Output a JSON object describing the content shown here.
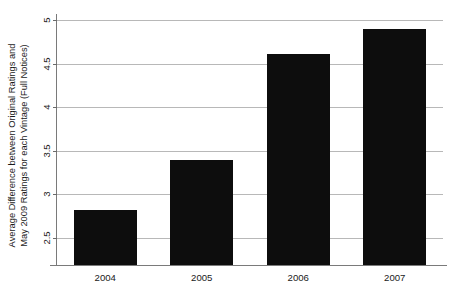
{
  "chart_data": {
    "type": "bar",
    "title": "",
    "subtitle": "",
    "xlabel": "",
    "ylabel": "Average Difference between Original Ratings and May 2009 Ratings for each Vintage (Full Notices)",
    "ylabel_lines": [
      "Average Difference between Original Ratings and",
      "May 2009 Ratings for each Vintage (Full Notices)"
    ],
    "categories": [
      "2004",
      "2005",
      "2006",
      "2007"
    ],
    "values": [
      2.82,
      3.4,
      4.61,
      4.9
    ],
    "series": [
      {
        "name": "Average Difference",
        "values": [
          2.82,
          3.4,
          4.61,
          4.9
        ]
      }
    ],
    "ylim": [
      2.19,
      5.0
    ],
    "y_axis_visible_min": 2.5,
    "yticks": [
      2.5,
      3,
      3.5,
      4,
      4.5,
      5
    ],
    "ytick_labels": [
      "2.5",
      "3",
      "3.5",
      "4",
      "4.5",
      "5"
    ],
    "xticks": [
      "2004",
      "2005",
      "2006",
      "2007"
    ],
    "grid": true,
    "grid_axis": "y",
    "legend": false,
    "legend_position": "none",
    "bar_color": "#0d0d0d",
    "grid_color": "#b8b8b8",
    "axis_color": "#7a7a7a",
    "text_color": "#1a1a1a",
    "background": "#ffffff",
    "annotations": []
  }
}
